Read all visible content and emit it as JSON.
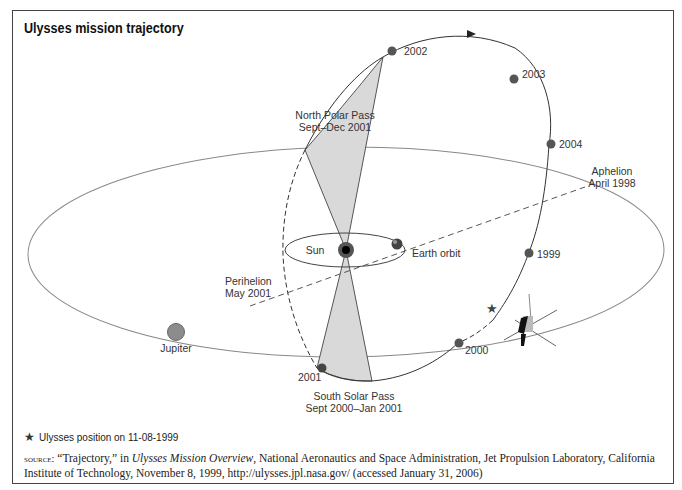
{
  "figure": {
    "top_label": "FIGURE 8.2",
    "title": "Ulysses mission trajectory"
  },
  "diagram": {
    "labels": {
      "north_polar_pass": [
        "North Polar Pass",
        "Sept–Dec 2001"
      ],
      "south_solar_pass": [
        "South Solar Pass",
        "Sept 2000–Jan 2001"
      ],
      "aphelion": [
        "Aphelion",
        "April 1998"
      ],
      "perihelion": [
        "Perihelion",
        "May 2001"
      ],
      "sun": "Sun",
      "earth_orbit": "Earth orbit",
      "jupiter": "Jupiter"
    },
    "years": {
      "y2002": "2002",
      "y2003": "2003",
      "y2004": "2004",
      "y1999": "1999",
      "y2000": "2000",
      "y2001": "2001"
    },
    "colors": {
      "orbit_line": "#777777",
      "trajectory_line": "#333333",
      "year_marker": "#555555",
      "pass_fill": "#d9d9d9",
      "jupiter_fill": "#8c8c8c"
    }
  },
  "legend": {
    "star_icon": "★",
    "text": "Ulysses position on 11-08-1999"
  },
  "source": {
    "prefix": "source:",
    "part1": " “Trajectory,” in ",
    "italic": "Ulysses Mission Overview",
    "part2": ", National Aeronautics and Space Administration, Jet Propulsion Laboratory, California Institute of Technology, November 8, 1999, http://ulysses.jpl.nasa.gov/ (accessed January 31, 2006)"
  }
}
